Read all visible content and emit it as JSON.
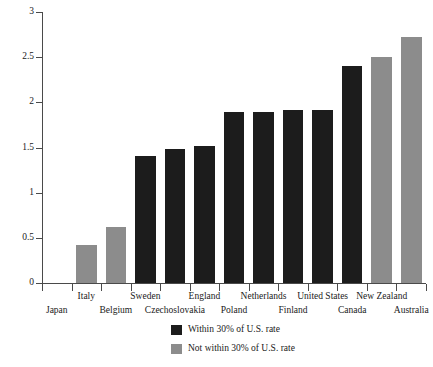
{
  "chart_data": {
    "type": "bar",
    "title": "",
    "subtitle": "",
    "xlabel": "",
    "ylabel": "",
    "ylim": [
      0,
      3
    ],
    "y_ticks": [
      "0",
      "0.5",
      "1",
      "1.5",
      "2",
      "2.5",
      "3"
    ],
    "y_tick_values": [
      0,
      0.5,
      1,
      1.5,
      2,
      2.5,
      3
    ],
    "grid": false,
    "legend_position": "bottom-center",
    "categories": [
      "Japan",
      "Italy",
      "Belgium",
      "Sweden",
      "Czechoslovakia",
      "England",
      "Poland",
      "Netherlands",
      "Finland",
      "United States",
      "Canada",
      "New Zealand",
      "Australia"
    ],
    "bars": [
      {
        "label": "Japan",
        "value": 0,
        "group": "within",
        "color": "#8c8c8c"
      },
      {
        "label": "Italy",
        "value": 0.42,
        "group": "not-within",
        "color": "#8c8c8c"
      },
      {
        "label": "Belgium",
        "value": 0.62,
        "group": "not-within",
        "color": "#8c8c8c"
      },
      {
        "label": "Sweden",
        "value": 1.41,
        "group": "within",
        "color": "#1c1c1c"
      },
      {
        "label": "Czechoslovakia",
        "value": 1.48,
        "group": "within",
        "color": "#1c1c1c"
      },
      {
        "label": "England",
        "value": 1.52,
        "group": "within",
        "color": "#1c1c1c"
      },
      {
        "label": "Poland",
        "value": 1.89,
        "group": "within",
        "color": "#1c1c1c"
      },
      {
        "label": "Netherlands",
        "value": 1.89,
        "group": "within",
        "color": "#1c1c1c"
      },
      {
        "label": "Finland",
        "value": 1.92,
        "group": "within",
        "color": "#1c1c1c"
      },
      {
        "label": "United States",
        "value": 1.92,
        "group": "within",
        "color": "#1c1c1c"
      },
      {
        "label": "Canada",
        "value": 2.4,
        "group": "within",
        "color": "#1c1c1c"
      },
      {
        "label": "New Zealand",
        "value": 2.5,
        "group": "not-within",
        "color": "#8c8c8c"
      },
      {
        "label": "Australia",
        "value": 2.72,
        "group": "not-within",
        "color": "#8c8c8c"
      }
    ],
    "legend": [
      {
        "label": "Within 30% of U.S. rate",
        "color": "#1c1c1c",
        "key": "within"
      },
      {
        "label": "Not within 30% of U.S. rate",
        "color": "#8c8c8c",
        "key": "not-within"
      }
    ]
  },
  "colors": {
    "within": "#1c1c1c",
    "not_within": "#8c8c8c",
    "axis": "#4a4a4a",
    "text": "#1a1a1a",
    "background": "#ffffff"
  }
}
